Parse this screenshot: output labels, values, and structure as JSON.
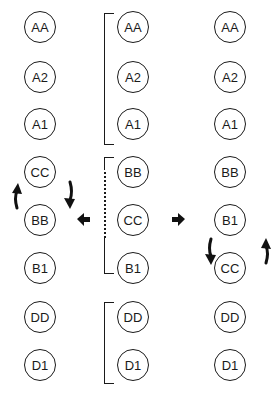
{
  "diagram": {
    "type": "chromosome-rearrangement",
    "columns": [
      {
        "id": "left",
        "label": "derived (BB/CC swapped)",
        "nodes": [
          "AA",
          "A2",
          "A1",
          "CC",
          "BB",
          "B1",
          "DD",
          "D1"
        ]
      },
      {
        "id": "middle",
        "label": "original",
        "nodes": [
          "AA",
          "A2",
          "A1",
          "BB",
          "CC",
          "B1",
          "DD",
          "D1"
        ]
      },
      {
        "id": "right",
        "label": "derived (B1/CC swapped)",
        "nodes": [
          "AA",
          "A2",
          "A1",
          "BB",
          "B1",
          "CC",
          "DD",
          "D1"
        ]
      }
    ],
    "brackets": [
      {
        "column": "middle",
        "spans": [
          "AA",
          "A1"
        ]
      },
      {
        "column": "middle",
        "spans": [
          "BB",
          "B1"
        ],
        "dotted_section": [
          "BB",
          "CC"
        ]
      },
      {
        "column": "middle",
        "spans": [
          "DD",
          "D1"
        ]
      }
    ],
    "arrows": [
      {
        "type": "block",
        "direction": "left",
        "from": "middle",
        "to": "left"
      },
      {
        "type": "block",
        "direction": "right",
        "from": "middle",
        "to": "right"
      },
      {
        "type": "curved-swap",
        "column": "left",
        "between": [
          "CC",
          "BB"
        ]
      },
      {
        "type": "curved-swap",
        "column": "right",
        "between": [
          "B1",
          "CC"
        ]
      }
    ],
    "colors": {
      "ink": "#1a1a1a",
      "background": "#ffffff"
    }
  }
}
